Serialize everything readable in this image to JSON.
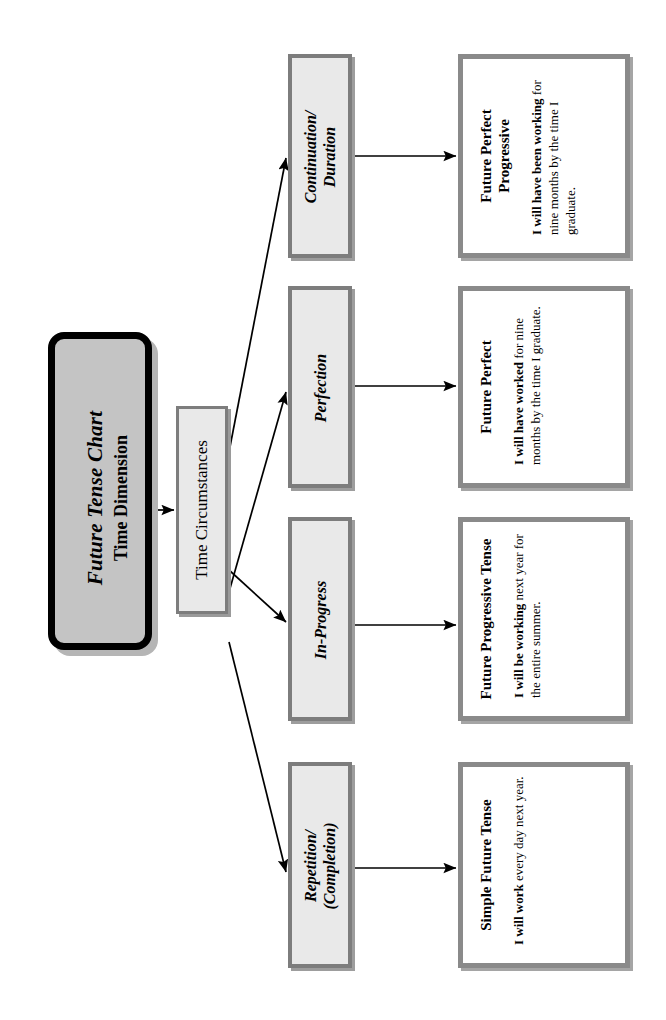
{
  "diagram": {
    "title_box": {
      "main_title": "Future Tense Chart",
      "subtitle": "Time Dimension"
    },
    "hub": {
      "label": "Time Circumstances"
    },
    "branches": [
      {
        "category": "Continuation/\nDuration",
        "tense_name": "Future Perfect\nProgressive",
        "example_bold": "I will have been working",
        "example_rest": " for nine months by the time I graduate."
      },
      {
        "category": "Perfection",
        "tense_name": "Future Perfect",
        "example_bold": "I will have worked",
        "example_rest": " for nine months by the time I graduate."
      },
      {
        "category": "In-Progress",
        "tense_name": "Future Progressive Tense",
        "example_bold": "I will be working",
        "example_rest": " next year for the entire summer."
      },
      {
        "category": "Repetition/\n(Completion)",
        "tense_name": "Simple Future Tense",
        "example_bold": "I will work",
        "example_rest": " every day next year."
      }
    ],
    "colors": {
      "page_background": "#ffffff",
      "title_fill": "#c4c4c4",
      "title_border": "#000000",
      "box_fill": "#e9e9e9",
      "box_border": "#7d7d7d",
      "detail_fill": "#ffffff",
      "detail_border": "#8a8a8a",
      "arrow": "#000000"
    }
  }
}
